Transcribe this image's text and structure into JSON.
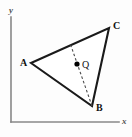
{
  "figure": {
    "caption": "Triangle ABC with interior point Q on a dashed cevian from B",
    "background_color": "#fdfdfd",
    "axes": {
      "x_axis_label": "x",
      "y_axis_label": "y",
      "axis_color": "#888888",
      "origin": {
        "x": 11,
        "y": 122
      },
      "x_axis_end": {
        "x": 119,
        "y": 122
      },
      "y_axis_end": {
        "x": 11,
        "y": 17
      }
    },
    "triangle": {
      "name": "ABC",
      "edge_color": "#1a1a1a",
      "fill_color": "#ffffff",
      "vertices": [
        {
          "id": "A",
          "label": "A",
          "x": 31,
          "y": 63,
          "label_x": 20,
          "label_y": 58
        },
        {
          "id": "B",
          "label": "B",
          "x": 92,
          "y": 106,
          "label_x": 96,
          "label_y": 103
        },
        {
          "id": "C",
          "label": "C",
          "x": 109,
          "y": 28,
          "label_x": 113,
          "label_y": 21
        }
      ],
      "edges": [
        {
          "from": "A",
          "to": "C"
        },
        {
          "from": "C",
          "to": "B"
        },
        {
          "from": "B",
          "to": "A"
        }
      ]
    },
    "interior_point": {
      "id": "Q",
      "label": "Q",
      "x": 77,
      "y": 64,
      "radius": 2.6,
      "color": "#000000",
      "label_x": 82,
      "label_y": 60
    },
    "cevian": {
      "from_vertex": "B",
      "from_x": 92,
      "from_y": 106,
      "to_x": 70,
      "to_y": 43,
      "style": "dashed",
      "color": "#4a4a4a",
      "passes_through": "Q"
    }
  }
}
